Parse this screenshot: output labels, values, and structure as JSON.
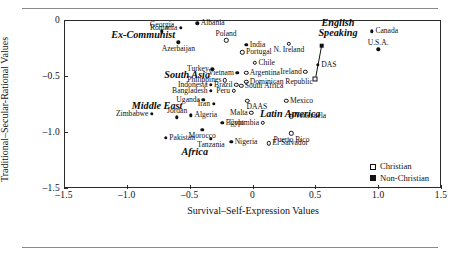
{
  "chart_data": {
    "type": "scatter",
    "title": "",
    "xlabel": "Survival–Self-Expression Values",
    "ylabel": "Traditional–Secular-Rational Values",
    "xlim": [
      -1.5,
      1.5
    ],
    "ylim": [
      -1.5,
      0
    ],
    "xticks": [
      "-1.5",
      "-1.0",
      "-0.5",
      "0",
      "0.5",
      "1.0",
      "1.5"
    ],
    "xtick_values": [
      -1.5,
      -1.0,
      -0.5,
      0,
      0.5,
      1.0,
      1.5
    ],
    "yticks": [
      "0",
      "-0.5",
      "-1.0",
      "-1.5"
    ],
    "ytick_values": [
      0,
      -0.5,
      -1.0,
      -1.5
    ],
    "grid": false,
    "legend_position": "bottom-right",
    "legend": [
      {
        "label": "Christian",
        "marker": "open-square"
      },
      {
        "label": "Non-Christian",
        "marker": "filled-square"
      }
    ],
    "cluster_labels": [
      {
        "text": "Ex-Communist",
        "x": -0.87,
        "y": -0.13
      },
      {
        "text": "South Asia",
        "x": -0.52,
        "y": -0.49
      },
      {
        "text": "Middle East",
        "x": -0.76,
        "y": -0.77
      },
      {
        "text": "Africa",
        "x": -0.46,
        "y": -1.18
      },
      {
        "text": "Latin America",
        "x": 0.3,
        "y": -0.84
      },
      {
        "text": "English\nSpeaking",
        "x": 0.68,
        "y": -0.07
      }
    ],
    "points": [
      {
        "name": "Georgia",
        "x": -0.72,
        "y": -0.1,
        "marker": "filled",
        "label_pos": "above"
      },
      {
        "name": "Albania",
        "x": -0.44,
        "y": -0.03,
        "marker": "filled",
        "label_pos": "right"
      },
      {
        "name": "Romania",
        "x": -0.57,
        "y": -0.07,
        "marker": "filled",
        "label_pos": "left"
      },
      {
        "name": "Azerbaijan",
        "x": -0.59,
        "y": -0.2,
        "marker": "filled",
        "label_pos": "below"
      },
      {
        "name": "Poland",
        "x": -0.21,
        "y": -0.18,
        "marker": "open",
        "label_pos": "above"
      },
      {
        "name": "India",
        "x": -0.05,
        "y": -0.22,
        "marker": "filled",
        "label_pos": "right"
      },
      {
        "name": "Portugal",
        "x": -0.08,
        "y": -0.29,
        "marker": "open",
        "label_pos": "right"
      },
      {
        "name": "Chile",
        "x": 0.02,
        "y": -0.38,
        "marker": "open",
        "label_pos": "right"
      },
      {
        "name": "Turkey",
        "x": -0.32,
        "y": -0.44,
        "marker": "filled",
        "label_pos": "left"
      },
      {
        "name": "Vietnam",
        "x": -0.12,
        "y": -0.47,
        "marker": "filled",
        "label_pos": "left"
      },
      {
        "name": "Argentina",
        "x": -0.05,
        "y": -0.47,
        "marker": "open",
        "label_pos": "right"
      },
      {
        "name": "Philippines",
        "x": -0.22,
        "y": -0.54,
        "marker": "open",
        "label_pos": "left"
      },
      {
        "name": "Dominican Republic",
        "x": -0.05,
        "y": -0.55,
        "marker": "open",
        "label_pos": "right"
      },
      {
        "name": "Indonesia",
        "x": -0.33,
        "y": -0.58,
        "marker": "filled",
        "label_pos": "left"
      },
      {
        "name": "Brazil",
        "x": -0.13,
        "y": -0.58,
        "marker": "open",
        "label_pos": "left"
      },
      {
        "name": "South Africa",
        "x": -0.09,
        "y": -0.59,
        "marker": "open",
        "label_pos": "right"
      },
      {
        "name": "Bangladesh",
        "x": -0.33,
        "y": -0.63,
        "marker": "filled",
        "label_pos": "left"
      },
      {
        "name": "Peru",
        "x": -0.15,
        "y": -0.63,
        "marker": "open",
        "label_pos": "left"
      },
      {
        "name": "Uganda",
        "x": -0.39,
        "y": -0.71,
        "marker": "filled",
        "label_pos": "left"
      },
      {
        "name": "Iran",
        "x": -0.31,
        "y": -0.75,
        "marker": "filled",
        "label_pos": "left"
      },
      {
        "name": "DAAS",
        "x": -0.04,
        "y": -0.72,
        "marker": "open",
        "label_pos": "below-right"
      },
      {
        "name": "Mexico",
        "x": 0.27,
        "y": -0.72,
        "marker": "open",
        "label_pos": "right"
      },
      {
        "name": "Zimbabwe",
        "x": -0.8,
        "y": -0.84,
        "marker": "filled",
        "label_pos": "left"
      },
      {
        "name": "Jordan",
        "x": -0.6,
        "y": -0.87,
        "marker": "filled",
        "label_pos": "above"
      },
      {
        "name": "Algeria",
        "x": -0.49,
        "y": -0.85,
        "marker": "filled",
        "label_pos": "right"
      },
      {
        "name": "Malta",
        "x": -0.01,
        "y": -0.83,
        "marker": "open",
        "label_pos": "left"
      },
      {
        "name": "Venezuela",
        "x": 0.31,
        "y": -0.86,
        "marker": "open",
        "label_pos": "right"
      },
      {
        "name": "Pakistan",
        "x": -0.69,
        "y": -1.05,
        "marker": "filled",
        "label_pos": "right"
      },
      {
        "name": "Egypt",
        "x": -0.24,
        "y": -0.92,
        "marker": "filled",
        "label_pos": "right"
      },
      {
        "name": "Colombia",
        "x": 0.08,
        "y": -0.92,
        "marker": "open",
        "label_pos": "left"
      },
      {
        "name": "Morocco",
        "x": -0.4,
        "y": -0.98,
        "marker": "filled",
        "label_pos": "below"
      },
      {
        "name": "Tanzania",
        "x": -0.33,
        "y": -1.06,
        "marker": "filled",
        "label_pos": "below"
      },
      {
        "name": "Nigeria",
        "x": -0.17,
        "y": -1.09,
        "marker": "filled",
        "label_pos": "right"
      },
      {
        "name": "El Salvador",
        "x": 0.13,
        "y": -1.1,
        "marker": "open",
        "label_pos": "right"
      },
      {
        "name": "Puerto Rico",
        "x": 0.31,
        "y": -1.01,
        "marker": "open",
        "label_pos": "below"
      },
      {
        "name": "N. Ireland",
        "x": 0.29,
        "y": -0.21,
        "marker": "open",
        "label_pos": "below"
      },
      {
        "name": "Ireland",
        "x": 0.42,
        "y": -0.46,
        "marker": "open",
        "label_pos": "left"
      },
      {
        "name": "DAS",
        "x": 0.52,
        "y": -0.4,
        "marker": "filled",
        "label_pos": "right"
      },
      {
        "name": "Canada",
        "x": 0.95,
        "y": -0.1,
        "marker": "filled",
        "label_pos": "right"
      },
      {
        "name": "U.S.A.",
        "x": 1.0,
        "y": -0.26,
        "marker": "filled",
        "label_pos": "above"
      }
    ],
    "das_connector": {
      "description": "vertical line linking DAS group markers",
      "top_marker": {
        "x": 0.55,
        "y": -0.23,
        "marker": "filled-square"
      },
      "mid_marker": {
        "x": 0.52,
        "y": -0.4,
        "marker": "filled"
      },
      "bottom_marker": {
        "x": 0.5,
        "y": -0.53,
        "marker": "open-square"
      }
    }
  }
}
